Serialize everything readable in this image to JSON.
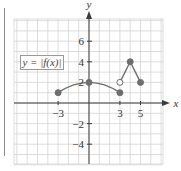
{
  "chart_data": {
    "type": "line",
    "title": "",
    "function_label": "y = |f(x)|",
    "xlabel": "x",
    "ylabel": "y",
    "xlim": [
      -7,
      7
    ],
    "ylim": [
      -6,
      8
    ],
    "grid": true,
    "x_tick_labels": [
      "-3",
      "3",
      "5"
    ],
    "y_tick_labels": [
      "6",
      "4",
      "2",
      "-2",
      "-4"
    ],
    "series": [
      {
        "name": "arc",
        "shape": "curve",
        "points": [
          [
            -3,
            1
          ],
          [
            0,
            2
          ],
          [
            3,
            1
          ]
        ],
        "endpoints": [
          {
            "x": -3,
            "y": 1,
            "filled": true
          },
          {
            "x": 0,
            "y": 2,
            "filled": true
          },
          {
            "x": 3,
            "y": 1,
            "filled": true
          }
        ]
      },
      {
        "name": "peak",
        "shape": "polyline",
        "points": [
          [
            3,
            2
          ],
          [
            4,
            4
          ],
          [
            5,
            2
          ]
        ],
        "endpoints": [
          {
            "x": 3,
            "y": 2,
            "filled": false
          },
          {
            "x": 4,
            "y": 4,
            "filled": true
          },
          {
            "x": 5,
            "y": 2,
            "filled": true
          }
        ]
      }
    ],
    "colors": {
      "curve": "#6e6e6e",
      "grid": "#d4d4d4",
      "axis": "#3a3a3a",
      "text": "#333333"
    }
  }
}
